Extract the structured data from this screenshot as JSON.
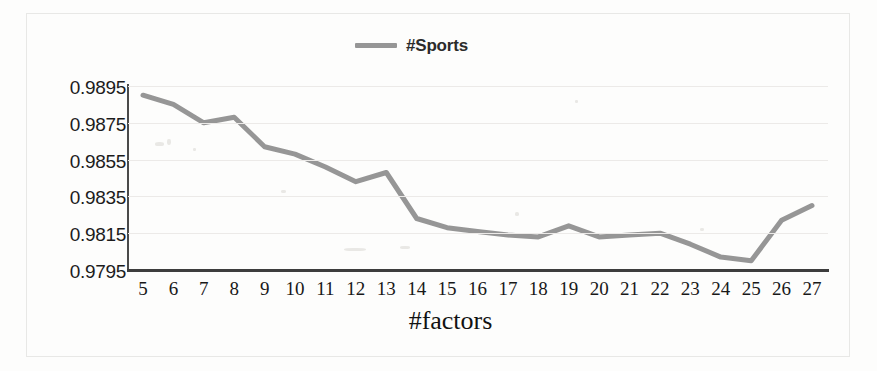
{
  "chart_data": {
    "type": "line",
    "title": "",
    "xlabel": "#factors",
    "ylabel": "",
    "categories": [
      5,
      6,
      7,
      8,
      9,
      10,
      11,
      12,
      13,
      14,
      15,
      16,
      17,
      18,
      19,
      20,
      21,
      22,
      23,
      24,
      25,
      26,
      27
    ],
    "series": [
      {
        "name": "#Sports",
        "color": "#969696",
        "values": [
          0.989,
          0.9885,
          0.9875,
          0.9878,
          0.9862,
          0.9858,
          0.9851,
          0.9843,
          0.9848,
          0.9823,
          0.9818,
          0.9816,
          0.9814,
          0.9813,
          0.9819,
          0.9813,
          0.9814,
          0.9815,
          0.9809,
          0.9802,
          0.98,
          0.9822,
          0.983
        ]
      }
    ],
    "ylim": [
      0.9795,
      0.9895
    ],
    "yticks": [
      "0.9895",
      "0.9875",
      "0.9855",
      "0.9835",
      "0.9815",
      "0.9795"
    ],
    "ytick_values": [
      0.9895,
      0.9875,
      0.9855,
      0.9835,
      0.9815,
      0.9795
    ],
    "xticks": [
      "5",
      "6",
      "7",
      "8",
      "9",
      "10",
      "11",
      "12",
      "13",
      "14",
      "15",
      "16",
      "17",
      "18",
      "19",
      "20",
      "21",
      "22",
      "23",
      "24",
      "25",
      "26",
      "27"
    ],
    "grid": true,
    "legend_position": "top-center"
  },
  "legend": {
    "entry_label": "#Sports"
  },
  "axis": {
    "x_title": "#factors"
  },
  "colors": {
    "series_line": "#969696",
    "gridline": "#eceae8",
    "axis": "#3d3d3d",
    "text": "#1c1c1c",
    "background": "#fdfdfc"
  }
}
